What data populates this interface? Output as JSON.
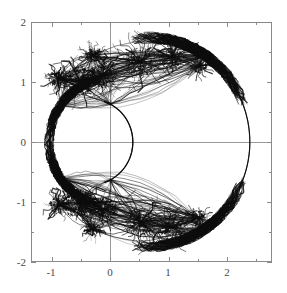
{
  "figure": {
    "title": "",
    "background_color": "#ffffff",
    "ink_color": "#111111",
    "axis_color": "#8a8a8a",
    "label_color": "#4a4a4a",
    "width_px": 287,
    "height_px": 293
  },
  "axes": {
    "plot_box": {
      "left_px": 31,
      "top_px": 22,
      "right_px": 272,
      "bottom_px": 262
    },
    "x": {
      "label": "",
      "min": -1.35,
      "max": 2.77,
      "major_ticks": [
        -1,
        0,
        1,
        2
      ],
      "major_tick_labels": [
        "-1",
        "0",
        "1",
        "2"
      ],
      "minor_tick_step": 0.5,
      "pixels_per_unit": 58.5,
      "origin_px": 110
    },
    "y": {
      "label": "",
      "min": -2,
      "max": 2,
      "major_ticks": [
        -2,
        -1,
        0,
        1,
        2
      ],
      "major_tick_labels": [
        "-2",
        "-1",
        "0",
        "1",
        "2"
      ],
      "minor_tick_step": 0.5,
      "pixels_per_unit": 60,
      "origin_px": 142
    },
    "grid": false,
    "zero_line_horizontal": true,
    "zero_line_vertical": true,
    "frame": true,
    "tick_direction": "in"
  },
  "chart_data": {
    "type": "scatter",
    "title": "",
    "subtitle": "",
    "xlabel": "",
    "ylabel": "",
    "xlim": [
      -1.35,
      2.77
    ],
    "ylim": [
      -2,
      2
    ],
    "grid": false,
    "legend": [],
    "annotations": [],
    "x_axis_crossings": [
      -1.03,
      0.39,
      2.39
    ],
    "extent": {
      "x_min_data": -1.05,
      "x_max_data": 2.4,
      "y_min_data": -1.62,
      "y_max_data": 1.62
    },
    "symmetry": "mirror about y = 0",
    "outer_arc": {
      "name": "outer smooth arc",
      "center": [
        0.66,
        0
      ],
      "radius": 1.73,
      "theta_start_deg": -62,
      "theta_end_deg": 62,
      "stroke_width": 1.1
    },
    "inner_arc": {
      "name": "inner smooth arc",
      "center": [
        -0.32,
        0
      ],
      "radius": 0.71,
      "theta_start_deg": -72,
      "theta_end_deg": 72,
      "stroke_width": 1.3
    },
    "left_arc": {
      "name": "left smooth arc",
      "center": [
        0.02,
        0
      ],
      "radius": 1.05,
      "theta_start_deg": 130,
      "theta_end_deg": 230,
      "stroke_width": 1.6
    },
    "clusters": [
      {
        "name": "main-upper-blob",
        "center": [
          -0.52,
          1.02
        ],
        "radius": 0.3,
        "density": 420,
        "roughness": 0.85
      },
      {
        "name": "upper-left-spur",
        "center": [
          -0.88,
          1.05
        ],
        "radius": 0.17,
        "density": 150,
        "roughness": 0.95
      },
      {
        "name": "upper-mid-blob",
        "center": [
          -0.12,
          1.12
        ],
        "radius": 0.26,
        "density": 300,
        "roughness": 0.9
      },
      {
        "name": "upper-right-wing",
        "center": [
          0.52,
          1.34
        ],
        "radius": 0.3,
        "density": 260,
        "roughness": 1.0
      },
      {
        "name": "upper-far-wing",
        "center": [
          1.06,
          1.42
        ],
        "radius": 0.26,
        "density": 200,
        "roughness": 1.0
      },
      {
        "name": "upper-tip",
        "center": [
          1.52,
          1.26
        ],
        "radius": 0.14,
        "density": 110,
        "roughness": 1.05
      },
      {
        "name": "upper-crest",
        "center": [
          -0.3,
          1.45
        ],
        "radius": 0.14,
        "density": 100,
        "roughness": 1.0
      }
    ],
    "filament_count": 340,
    "point_count_estimate": 18000
  },
  "ticks": {
    "x_labels": [
      {
        "value": -1,
        "text": "-1",
        "px": 51
      },
      {
        "value": 0,
        "text": "0",
        "px": 110
      },
      {
        "value": 1,
        "text": "1",
        "px": 168
      },
      {
        "value": 2,
        "text": "2",
        "px": 227
      }
    ],
    "y_labels": [
      {
        "value": 2,
        "text": "2",
        "px": 22
      },
      {
        "value": 1,
        "text": "1",
        "px": 82
      },
      {
        "value": 0,
        "text": "0",
        "px": 142
      },
      {
        "value": -1,
        "text": "-1",
        "px": 202
      },
      {
        "value": -2,
        "text": "-2",
        "px": 262
      }
    ]
  }
}
